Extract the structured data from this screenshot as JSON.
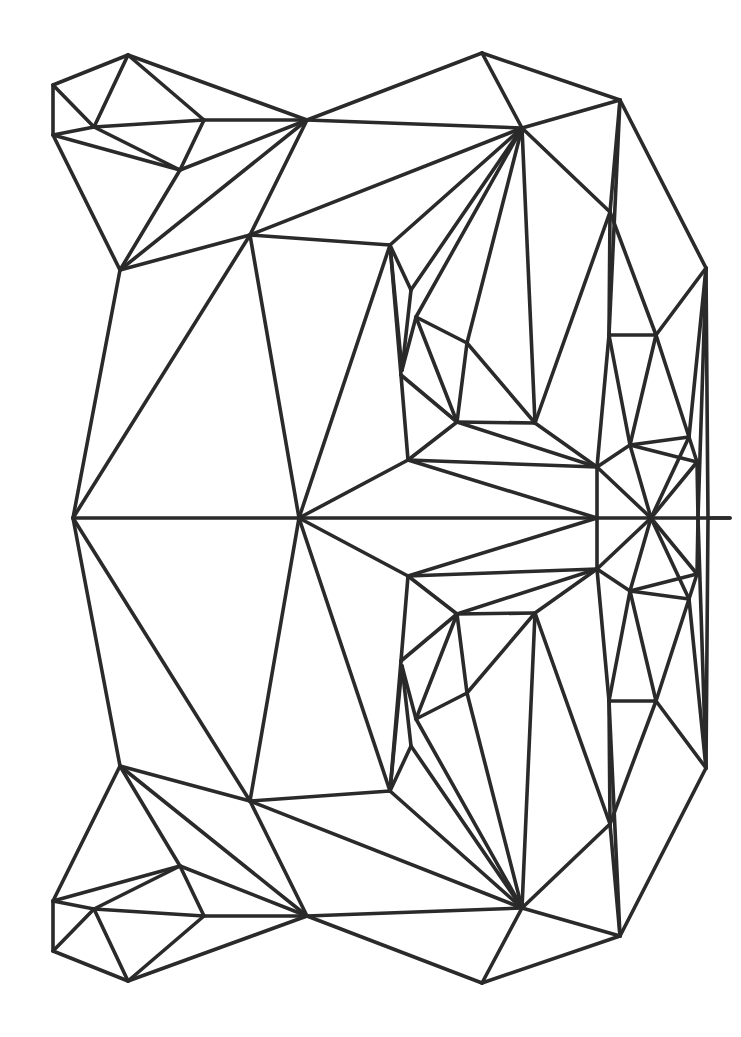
{
  "drawing": {
    "stroke_color": "#2a2a2a",
    "stroke_width": 3.6,
    "background": "#ffffff",
    "symmetry_axis_y": 518,
    "vertices": {
      "A": [
        128,
        55
      ],
      "B": [
        53,
        85
      ],
      "C": [
        53,
        135
      ],
      "D": [
        94,
        127
      ],
      "E": [
        204,
        120
      ],
      "F": [
        180,
        170
      ],
      "G": [
        307,
        120
      ],
      "H": [
        120,
        270
      ],
      "I": [
        250,
        235
      ],
      "J": [
        390,
        245
      ],
      "K": [
        482,
        53
      ],
      "L": [
        522,
        128
      ],
      "M": [
        620,
        100
      ],
      "N": [
        411,
        290
      ],
      "O": [
        416,
        317
      ],
      "P": [
        402,
        370
      ],
      "Q": [
        401,
        375
      ],
      "R": [
        467,
        343
      ],
      "S": [
        457,
        422
      ],
      "T": [
        535,
        423
      ],
      "U": [
        610,
        212
      ],
      "V": [
        609,
        335
      ],
      "W": [
        656,
        335
      ],
      "X": [
        706,
        268
      ],
      "Y": [
        708,
        518
      ],
      "Z": [
        408,
        460
      ],
      "AA": [
        597,
        467
      ],
      "AB": [
        630,
        445
      ],
      "AC": [
        689,
        437
      ],
      "AD": [
        697,
        462
      ],
      "AE": [
        651,
        518
      ],
      "AF": [
        597,
        518
      ],
      "AG": [
        698,
        518
      ],
      "AH": [
        73,
        518
      ],
      "AI": [
        299,
        518
      ],
      "AJ": [
        730,
        518
      ]
    },
    "edges_top_half": [
      [
        "B",
        "A"
      ],
      [
        "B",
        "C"
      ],
      [
        "B",
        "D"
      ],
      [
        "A",
        "D"
      ],
      [
        "A",
        "E"
      ],
      [
        "A",
        "G"
      ],
      [
        "C",
        "D"
      ],
      [
        "D",
        "E"
      ],
      [
        "D",
        "F"
      ],
      [
        "C",
        "F"
      ],
      [
        "E",
        "G"
      ],
      [
        "E",
        "F"
      ],
      [
        "F",
        "G"
      ],
      [
        "C",
        "H"
      ],
      [
        "F",
        "H"
      ],
      [
        "G",
        "H"
      ],
      [
        "G",
        "I"
      ],
      [
        "H",
        "I"
      ],
      [
        "G",
        "K"
      ],
      [
        "G",
        "L"
      ],
      [
        "K",
        "L"
      ],
      [
        "K",
        "M"
      ],
      [
        "L",
        "M"
      ],
      [
        "I",
        "L"
      ],
      [
        "I",
        "J"
      ],
      [
        "J",
        "L"
      ],
      [
        "J",
        "N"
      ],
      [
        "N",
        "L"
      ],
      [
        "O",
        "L"
      ],
      [
        "R",
        "L"
      ],
      [
        "T",
        "L"
      ],
      [
        "U",
        "L"
      ],
      [
        "J",
        "P"
      ],
      [
        "N",
        "P"
      ],
      [
        "O",
        "P"
      ],
      [
        "O",
        "R"
      ],
      [
        "O",
        "S"
      ],
      [
        "R",
        "S"
      ],
      [
        "R",
        "T"
      ],
      [
        "S",
        "T"
      ],
      [
        "U",
        "T"
      ],
      [
        "U",
        "V"
      ],
      [
        "M",
        "U"
      ],
      [
        "M",
        "V"
      ],
      [
        "M",
        "X"
      ],
      [
        "V",
        "W"
      ],
      [
        "W",
        "X"
      ],
      [
        "U",
        "W"
      ],
      [
        "J",
        "Q"
      ],
      [
        "Q",
        "Z"
      ],
      [
        "Q",
        "S"
      ],
      [
        "S",
        "Z"
      ],
      [
        "S",
        "AA"
      ],
      [
        "T",
        "AA"
      ],
      [
        "Z",
        "AA"
      ],
      [
        "V",
        "AB"
      ],
      [
        "W",
        "AB"
      ],
      [
        "W",
        "AC"
      ],
      [
        "X",
        "AC"
      ],
      [
        "X",
        "Y"
      ],
      [
        "X",
        "AG"
      ],
      [
        "AB",
        "AC"
      ],
      [
        "AB",
        "AD"
      ],
      [
        "AC",
        "AD"
      ],
      [
        "AB",
        "AA"
      ],
      [
        "V",
        "AA"
      ],
      [
        "AC",
        "AE"
      ],
      [
        "AA",
        "AF"
      ],
      [
        "AA",
        "AE"
      ],
      [
        "AB",
        "AE"
      ],
      [
        "AD",
        "AG"
      ],
      [
        "AD",
        "AE"
      ],
      [
        "AG",
        "AJ"
      ],
      [
        "Y",
        "AJ"
      ],
      [
        "H",
        "AH"
      ],
      [
        "I",
        "AH"
      ],
      [
        "I",
        "AI"
      ],
      [
        "J",
        "AI"
      ],
      [
        "Z",
        "AI"
      ],
      [
        "Z",
        "AF"
      ],
      [
        "AH",
        "AI"
      ],
      [
        "AI",
        "AF"
      ],
      [
        "AF",
        "AE"
      ],
      [
        "AE",
        "AG"
      ]
    ]
  }
}
